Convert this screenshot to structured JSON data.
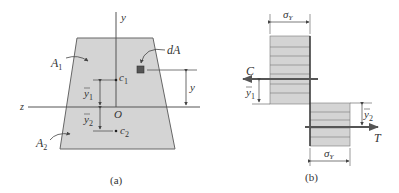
{
  "figure_a": {
    "caption": "(a)",
    "axis_y": "y",
    "axis_z": "z",
    "origin": "O",
    "area_upper": "A",
    "area_upper_sub": "1",
    "area_lower": "A",
    "area_lower_sub": "2",
    "element": "dA",
    "centroid_upper": "c",
    "centroid_upper_sub": "1",
    "centroid_lower": "c",
    "centroid_lower_sub": "2",
    "dist_upper": "y",
    "dist_upper_sub": "1",
    "dist_lower": "y",
    "dist_lower_sub": "2",
    "dist_element": "y"
  },
  "figure_b": {
    "caption": "(b)",
    "stress_top": "σ",
    "stress_top_sub": "Y",
    "stress_bottom": "σ",
    "stress_bottom_sub": "Y",
    "compression": "C",
    "tension": "T",
    "dist_upper": "y",
    "dist_upper_sub": "1",
    "dist_lower": "y",
    "dist_lower_sub": "2"
  },
  "colors": {
    "fill": "#d4d4d4",
    "line": "#555555",
    "dark": "#333333",
    "element": "#555555"
  }
}
